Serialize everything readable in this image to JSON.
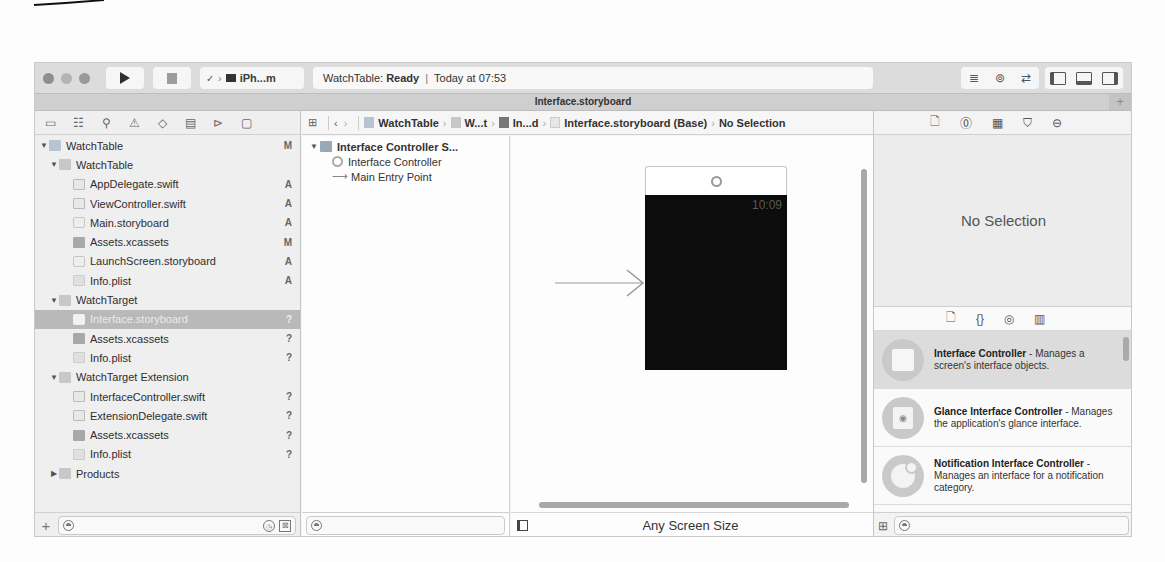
{
  "toolbar": {
    "scheme_label": "iPh...m",
    "status_project": "WatchTable:",
    "status_state": "Ready",
    "status_separator": "|",
    "status_time": "Today at 07:53"
  },
  "tabbar": {
    "title": "Interface.storyboard",
    "add_label": "+"
  },
  "navigator": {
    "icons": [
      "folder-icon",
      "hierarchy-icon",
      "search-icon",
      "warning-icon",
      "test-icon",
      "debug-icon",
      "breakpoint-icon",
      "report-icon"
    ],
    "tree": [
      {
        "label": "WatchTable",
        "level": 0,
        "type": "proj",
        "expanded": true,
        "badge": "M"
      },
      {
        "label": "WatchTable",
        "level": 1,
        "type": "folder",
        "expanded": true,
        "badge": ""
      },
      {
        "label": "AppDelegate.swift",
        "level": 2,
        "type": "swift",
        "badge": "A"
      },
      {
        "label": "ViewController.swift",
        "level": 2,
        "type": "swift",
        "badge": "A"
      },
      {
        "label": "Main.storyboard",
        "level": 2,
        "type": "story",
        "badge": "A"
      },
      {
        "label": "Assets.xcassets",
        "level": 2,
        "type": "assets",
        "badge": "M"
      },
      {
        "label": "LaunchScreen.storyboard",
        "level": 2,
        "type": "story",
        "badge": "A"
      },
      {
        "label": "Info.plist",
        "level": 2,
        "type": "plist",
        "badge": "A"
      },
      {
        "label": "WatchTarget",
        "level": 1,
        "type": "folder",
        "expanded": true,
        "badge": ""
      },
      {
        "label": "Interface.storyboard",
        "level": 2,
        "type": "story",
        "badge": "?",
        "selected": true
      },
      {
        "label": "Assets.xcassets",
        "level": 2,
        "type": "assets",
        "badge": "?"
      },
      {
        "label": "Info.plist",
        "level": 2,
        "type": "plist",
        "badge": "?"
      },
      {
        "label": "WatchTarget Extension",
        "level": 1,
        "type": "folder",
        "expanded": true,
        "badge": ""
      },
      {
        "label": "InterfaceController.swift",
        "level": 2,
        "type": "swift",
        "badge": "?"
      },
      {
        "label": "ExtensionDelegate.swift",
        "level": 2,
        "type": "swift",
        "badge": "?"
      },
      {
        "label": "Assets.xcassets",
        "level": 2,
        "type": "assets",
        "badge": "?"
      },
      {
        "label": "Info.plist",
        "level": 2,
        "type": "plist",
        "badge": "?"
      },
      {
        "label": "Products",
        "level": 1,
        "type": "folder",
        "expanded": false,
        "badge": ""
      }
    ],
    "footer": {
      "add_label": "+",
      "filter_placeholder": ""
    }
  },
  "jumpbar": {
    "crumbs": [
      "WatchTable",
      "W...t",
      "In...d",
      "Interface.storyboard (Base)",
      "No Selection"
    ]
  },
  "outline": {
    "scene": "Interface Controller S...",
    "items": [
      "Interface Controller",
      "Main Entry Point"
    ]
  },
  "canvas": {
    "watch_time": "10:09",
    "size_class": "Any Screen Size"
  },
  "inspector": {
    "tabs": [
      "file-icon",
      "help-icon",
      "identity-icon",
      "attributes-icon",
      "connections-icon"
    ],
    "empty_label": "No Selection"
  },
  "library": {
    "tabs": [
      "file-template-icon",
      "code-snippet-icon",
      "object-icon",
      "media-icon"
    ],
    "items": [
      {
        "title": "Interface Controller",
        "desc": " - Manages a screen's interface objects."
      },
      {
        "title": "Glance Interface Controller",
        "desc": " - Manages the application's glance interface."
      },
      {
        "title": "Notification Interface Controller",
        "desc": " - Manages an interface for a notification category."
      }
    ]
  }
}
